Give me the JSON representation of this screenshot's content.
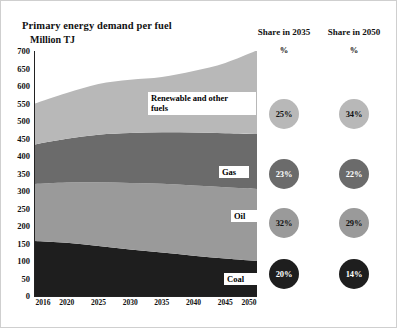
{
  "chart_title": "Primary energy demand per fuel",
  "unit_label": "Million TJ",
  "columns": [
    {
      "header": "Share in 2035",
      "pct_symbol": "%"
    },
    {
      "header": "Share in 2050",
      "pct_symbol": "%"
    }
  ],
  "chart_data": {
    "type": "area",
    "title": "Primary energy demand per fuel",
    "subtitle": "",
    "xlabel": "",
    "ylabel": "Million TJ",
    "ylim": [
      0,
      700
    ],
    "yticks": [
      0,
      50,
      100,
      150,
      200,
      250,
      300,
      350,
      400,
      450,
      500,
      550,
      600,
      650,
      700
    ],
    "grid": false,
    "legend": "in-plot labels",
    "stacked": true,
    "x": [
      2016,
      2020,
      2025,
      2030,
      2035,
      2040,
      2045,
      2050
    ],
    "xtick_labels": [
      "2016",
      "2020",
      "2025",
      "2030",
      "2035",
      "2040",
      "2045",
      "2050"
    ],
    "series": [
      {
        "name": "Coal",
        "color": "#1e1e1e",
        "order": 1,
        "values": [
          157,
          152,
          143,
          133,
          124,
          115,
          107,
          100
        ]
      },
      {
        "name": "Oil",
        "color": "#9a9a9a",
        "order": 2,
        "values": [
          163,
          172,
          182,
          190,
          197,
          201,
          204,
          206
        ]
      },
      {
        "name": "Gas",
        "color": "#6b6b6b",
        "order": 3,
        "values": [
          113,
          125,
          136,
          143,
          147,
          151,
          154,
          157
        ]
      },
      {
        "name": "Renewable and other fuels",
        "color": "#b8b8b8",
        "order": 4,
        "values": [
          117,
          131,
          145,
          152,
          158,
          176,
          201,
          239
        ]
      }
    ],
    "cumulative_tops": {
      "coal": [
        157,
        152,
        143,
        133,
        124,
        115,
        107,
        100
      ],
      "oil": [
        320,
        324,
        325,
        323,
        321,
        316,
        311,
        306
      ],
      "gas": [
        433,
        449,
        461,
        466,
        468,
        467,
        465,
        463
      ],
      "renewables": [
        550,
        580,
        606,
        618,
        626,
        643,
        666,
        702
      ]
    },
    "annotations": [
      {
        "text": "Renewable and other\nfuels",
        "series": "Renewable and other fuels"
      },
      {
        "text": "Gas",
        "series": "Gas"
      },
      {
        "text": "Oil",
        "series": "Oil"
      },
      {
        "text": "Coal",
        "series": "Coal"
      }
    ],
    "share_table": {
      "columns": [
        "Share in 2035",
        "Share in 2050"
      ],
      "rows": [
        {
          "series": "Renewable and other fuels",
          "color": "#b8b8b8",
          "share_2035": "25%",
          "share_2050": "34%"
        },
        {
          "series": "Gas",
          "color": "#6b6b6b",
          "share_2035": "23%",
          "share_2050": "22%"
        },
        {
          "series": "Oil",
          "color": "#9a9a9a",
          "share_2035": "32%",
          "share_2050": "29%"
        },
        {
          "series": "Coal",
          "color": "#1e1e1e",
          "share_2035": "20%",
          "share_2050": "14%"
        }
      ]
    }
  }
}
